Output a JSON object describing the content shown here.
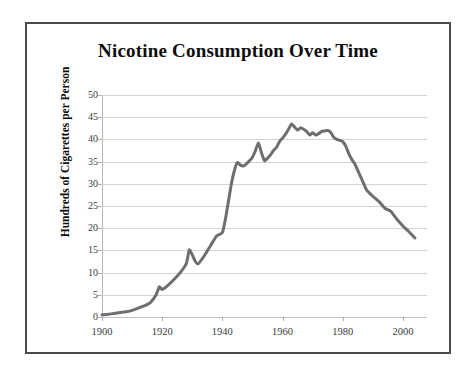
{
  "figure": {
    "background_color": "#ffffff",
    "border_color": "#4a4a4a"
  },
  "chart_data": {
    "type": "line",
    "title": "Nicotine Consumption Over Time",
    "xlabel": "",
    "ylabel": "Hundreds of Cigarettes per Person",
    "xlim": [
      1900,
      2008
    ],
    "ylim": [
      0,
      50
    ],
    "xticks": [
      1900,
      1920,
      1940,
      1960,
      1980,
      2000
    ],
    "xtick_labels": [
      "1900",
      "1920",
      "1940",
      "1960",
      "1980",
      "2000"
    ],
    "yticks": [
      0,
      5,
      10,
      15,
      20,
      25,
      30,
      35,
      40,
      45,
      50
    ],
    "ytick_labels": [
      "0",
      "5",
      "10",
      "15",
      "20",
      "25",
      "30",
      "35",
      "40",
      "45",
      "50"
    ],
    "grid": "horizontal",
    "legend": "none",
    "line_color": "#6e6e6e",
    "line_width": 3,
    "series": [
      {
        "name": "Cigarettes per person",
        "x": [
          1900,
          1902,
          1904,
          1906,
          1908,
          1910,
          1912,
          1914,
          1916,
          1918,
          1919,
          1920,
          1922,
          1924,
          1926,
          1928,
          1929,
          1930,
          1931,
          1932,
          1934,
          1936,
          1938,
          1940,
          1941,
          1942,
          1943,
          1944,
          1945,
          1946,
          1947,
          1948,
          1949,
          1950,
          1951,
          1952,
          1953,
          1954,
          1955,
          1956,
          1957,
          1958,
          1959,
          1960,
          1961,
          1962,
          1963,
          1964,
          1965,
          1966,
          1967,
          1968,
          1969,
          1970,
          1971,
          1972,
          1973,
          1974,
          1975,
          1976,
          1977,
          1978,
          1979,
          1980,
          1981,
          1982,
          1983,
          1984,
          1985,
          1986,
          1987,
          1988,
          1990,
          1992,
          1994,
          1996,
          1998,
          2000,
          2002,
          2004
        ],
        "y": [
          0.5,
          0.6,
          0.8,
          1.0,
          1.2,
          1.5,
          2.0,
          2.5,
          3.2,
          5.0,
          6.8,
          6.2,
          7.2,
          8.5,
          10.0,
          12.0,
          15.1,
          14.0,
          12.5,
          12.0,
          13.8,
          16.0,
          18.2,
          19.0,
          22.0,
          26.0,
          30.0,
          33.0,
          34.8,
          34.2,
          34.0,
          34.5,
          35.2,
          36.0,
          37.5,
          39.2,
          37.0,
          35.2,
          35.8,
          36.5,
          37.5,
          38.2,
          39.5,
          40.3,
          41.2,
          42.3,
          43.5,
          42.8,
          42.1,
          42.6,
          42.3,
          41.8,
          41.0,
          41.5,
          41.0,
          41.3,
          41.8,
          41.9,
          42.0,
          41.6,
          40.5,
          40.0,
          39.8,
          39.5,
          38.5,
          36.8,
          35.5,
          34.5,
          33.0,
          31.5,
          30.0,
          28.5,
          27.2,
          26.0,
          24.5,
          23.8,
          22.0,
          20.5,
          19.2,
          17.8
        ]
      }
    ],
    "annotations": []
  }
}
